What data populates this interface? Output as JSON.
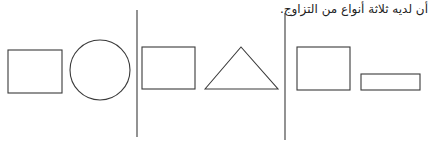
{
  "caption": "أن لديه ثلاثة أنواع من التزاوج.",
  "colors": {
    "stroke": "#3a3a3a",
    "background": "#ffffff"
  },
  "groups": [
    {
      "name": "group-1",
      "shapes": [
        "rectangle",
        "circle"
      ]
    },
    {
      "name": "group-2",
      "shapes": [
        "rectangle",
        "triangle"
      ]
    },
    {
      "name": "group-3",
      "shapes": [
        "rectangle",
        "thin-rectangle"
      ]
    }
  ]
}
